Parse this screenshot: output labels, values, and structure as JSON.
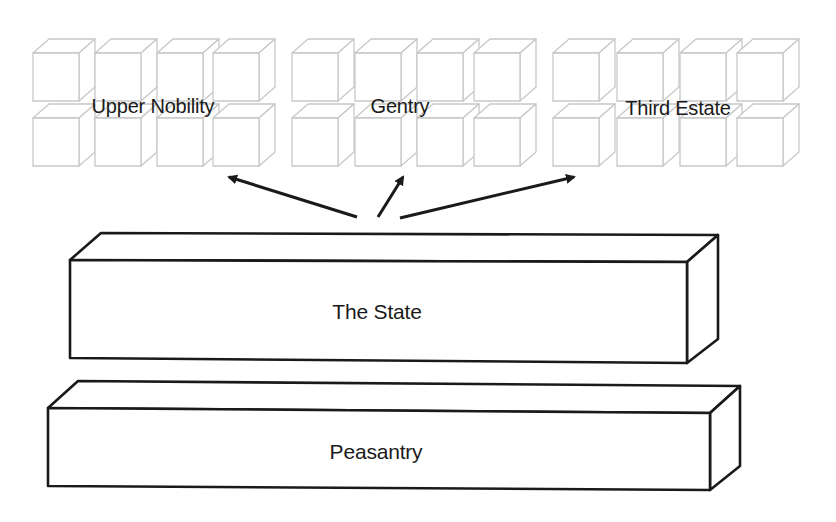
{
  "diagram": {
    "type": "social-structure",
    "groups": [
      {
        "id": "upper-nobility",
        "label": "Upper Nobility",
        "cube_cols": [
          33,
          95,
          157,
          213
        ],
        "label_pos": [
          153,
          106
        ]
      },
      {
        "id": "gentry",
        "label": "Gentry",
        "cube_cols": [
          292,
          355,
          417,
          474
        ],
        "label_pos": [
          400,
          106
        ]
      },
      {
        "id": "third-estate",
        "label": "Third Estate",
        "cube_cols": [
          553,
          617,
          680,
          737
        ],
        "label_pos": [
          678,
          108
        ]
      }
    ],
    "cube": {
      "w": 46,
      "h": 48,
      "dx": 16,
      "dy": -14,
      "rows": [
        53,
        118
      ],
      "stroke": "#c8c8c8"
    },
    "arrows": [
      {
        "to": "upper-nobility",
        "from": [
          357,
          217
        ],
        "tip": [
          229,
          177
        ]
      },
      {
        "to": "gentry",
        "from": [
          378,
          217
        ],
        "tip": [
          403,
          177
        ]
      },
      {
        "to": "third-estate",
        "from": [
          400,
          218
        ],
        "tip": [
          574,
          177
        ]
      }
    ],
    "bars": [
      {
        "id": "the-state",
        "label": "The State",
        "front": {
          "x1": 70,
          "y1": 260,
          "x2": 687,
          "y2": 262,
          "bottom_left": 358,
          "bottom_right": 363
        },
        "back_offset": [
          31,
          -27
        ],
        "label_pos": [
          377,
          312
        ]
      },
      {
        "id": "peasantry",
        "label": "Peasantry",
        "front": {
          "x1": 48,
          "y1": 408,
          "x2": 710,
          "y2": 413,
          "bottom_left": 486,
          "bottom_right": 490
        },
        "back_offset": [
          30,
          -27
        ],
        "label_pos": [
          376,
          452
        ]
      }
    ],
    "colors": {
      "ink": "#1a1a1a",
      "cube_line": "#c8c8c8",
      "background": "#ffffff"
    }
  }
}
